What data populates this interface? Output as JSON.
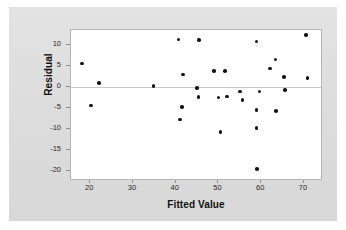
{
  "chart_data": {
    "type": "scatter",
    "title": "",
    "xlabel": "Fitted Value",
    "ylabel": "Residual",
    "xlim": [
      15.5,
      74.0
    ],
    "ylim": [
      -22.0,
      13.5
    ],
    "xticks": [
      20,
      30,
      40,
      50,
      60,
      70
    ],
    "yticks": [
      10,
      5,
      0,
      -5,
      -10,
      -15,
      -20
    ],
    "xtick_labels": [
      "20",
      "30",
      "40",
      "50",
      "60",
      "70"
    ],
    "ytick_labels": [
      "10",
      "5",
      "0",
      "-5",
      "-10",
      "-15",
      "-20"
    ],
    "grid": false,
    "legend": null,
    "reference_line": {
      "axis": "y",
      "value": 0,
      "color": "#c9c9c9"
    },
    "marker": {
      "shape": "circle",
      "color": "#141414",
      "size": 3.6
    },
    "points": [
      {
        "x": 18.1,
        "y": 5.5
      },
      {
        "x": 20.2,
        "y": -4.5
      },
      {
        "x": 22.0,
        "y": 0.9
      },
      {
        "x": 34.8,
        "y": 0.2
      },
      {
        "x": 40.7,
        "y": 11.2
      },
      {
        "x": 41.0,
        "y": -7.8
      },
      {
        "x": 41.5,
        "y": -4.9
      },
      {
        "x": 41.7,
        "y": 2.9
      },
      {
        "x": 45.0,
        "y": -0.3
      },
      {
        "x": 45.3,
        "y": -2.4
      },
      {
        "x": 45.5,
        "y": 11.1
      },
      {
        "x": 49.0,
        "y": 3.8
      },
      {
        "x": 50.0,
        "y": -2.6
      },
      {
        "x": 50.5,
        "y": -10.8
      },
      {
        "x": 51.5,
        "y": 3.7
      },
      {
        "x": 52.0,
        "y": -2.3
      },
      {
        "x": 55.0,
        "y": -1.2
      },
      {
        "x": 55.6,
        "y": -3.2
      },
      {
        "x": 58.9,
        "y": 10.8
      },
      {
        "x": 58.9,
        "y": -5.5
      },
      {
        "x": 58.9,
        "y": -9.8
      },
      {
        "x": 59.0,
        "y": -19.6
      },
      {
        "x": 59.6,
        "y": -1.2
      },
      {
        "x": 62.0,
        "y": 4.3
      },
      {
        "x": 63.4,
        "y": 6.5
      },
      {
        "x": 63.5,
        "y": -5.8
      },
      {
        "x": 65.4,
        "y": 2.3
      },
      {
        "x": 65.6,
        "y": -0.8
      },
      {
        "x": 70.5,
        "y": 12.3
      },
      {
        "x": 70.8,
        "y": 2.0
      }
    ],
    "colors": {
      "figure_background": "#dedede",
      "plot_background": "#ffffff",
      "axis_line": "#b6b6b6",
      "tick": "#8f8f8f",
      "text": "#111111",
      "marker": "#141414"
    }
  }
}
